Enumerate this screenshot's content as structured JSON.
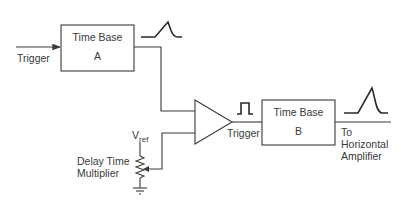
{
  "diagram": {
    "trigger_input_label": "Trigger",
    "time_base_a": {
      "title": "Time Base",
      "sub": "A"
    },
    "time_base_b": {
      "title": "Time Base",
      "sub": "B"
    },
    "comparator_output_label": "Trigger",
    "vref_label": "V",
    "vref_subscript": "ref",
    "pot_label_line1": "Delay Time",
    "pot_label_line2": "Multiplier",
    "output_label_line1": "To",
    "output_label_line2": "Horizontal",
    "output_label_line3": "Amplifier",
    "waveforms": [
      "ramp-a",
      "gate-pulse",
      "ramp-b"
    ],
    "line_color": "#3a3a3a"
  }
}
